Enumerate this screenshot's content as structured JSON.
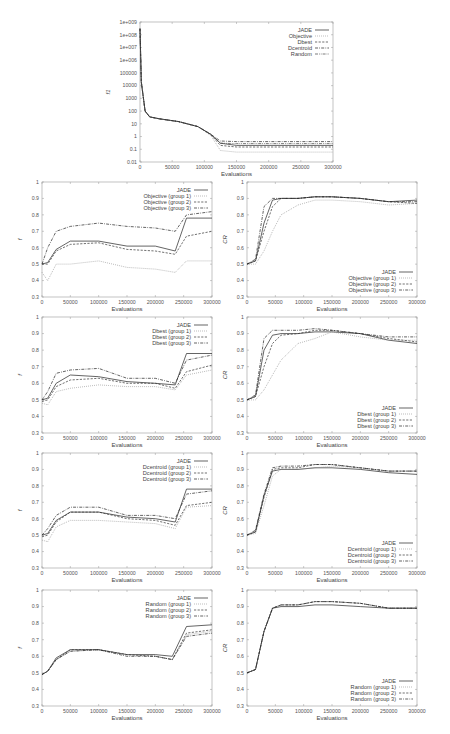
{
  "chart_data": [
    {
      "id": "top",
      "type": "line",
      "title": "",
      "xlabel": "Evaluations",
      "ylabel": "f1",
      "yscale": "log",
      "xlim": [
        0,
        300000
      ],
      "ylim": [
        0.01,
        1000000000
      ],
      "xticks": [
        "0",
        "50000",
        "100000",
        "150000",
        "200000",
        "250000",
        "300000"
      ],
      "yticks": [
        "0.01",
        "0.1",
        "1",
        "10",
        "100",
        "1000",
        "10000",
        "100000",
        "1e+006",
        "1e+007",
        "1e+008",
        "1e+009"
      ],
      "legend_position": "top-right",
      "x": [
        0,
        2000,
        8000,
        15000,
        30000,
        60000,
        90000,
        110000,
        125000,
        150000,
        300000
      ],
      "series": [
        {
          "name": "JADE",
          "style": "solid",
          "values": [
            300000000,
            20000,
            100,
            35,
            25,
            15,
            6,
            1.5,
            0.3,
            0.2,
            0.2
          ]
        },
        {
          "name": "Objective",
          "style": "dotted",
          "values": [
            300000000,
            20000,
            100,
            35,
            25,
            15,
            6,
            1.2,
            0.08,
            0.06,
            0.06
          ]
        },
        {
          "name": "Dbest",
          "style": "dashed",
          "values": [
            300000000,
            20000,
            100,
            35,
            25,
            15,
            6,
            1.4,
            0.2,
            0.15,
            0.15
          ]
        },
        {
          "name": "Dcentroid",
          "style": "dash-dot",
          "values": [
            300000000,
            20000,
            100,
            35,
            25,
            15,
            6,
            1.5,
            0.45,
            0.4,
            0.4
          ]
        },
        {
          "name": "Random",
          "style": "dash-dot-dot",
          "values": [
            300000000,
            20000,
            100,
            35,
            25,
            15,
            6,
            1.5,
            0.3,
            0.28,
            0.28
          ]
        }
      ]
    },
    {
      "id": "objective-f",
      "type": "line",
      "xlabel": "Evaluations",
      "ylabel": "f",
      "xlim": [
        0,
        300000
      ],
      "ylim": [
        0.3,
        1
      ],
      "xticks": [
        "0",
        "50000",
        "100000",
        "150000",
        "200000",
        "250000",
        "300000"
      ],
      "yticks": [
        "0.3",
        "0.4",
        "0.5",
        "0.6",
        "0.7",
        "0.8",
        "0.9",
        "1"
      ],
      "legend_position": "top-right",
      "x": [
        0,
        10000,
        25000,
        50000,
        100000,
        150000,
        200000,
        235000,
        255000,
        300000
      ],
      "series": [
        {
          "name": "JADE",
          "style": "solid",
          "values": [
            0.5,
            0.51,
            0.59,
            0.64,
            0.64,
            0.61,
            0.61,
            0.58,
            0.78,
            0.78
          ]
        },
        {
          "name": "Objective (group 1)",
          "style": "dotted",
          "values": [
            0.45,
            0.4,
            0.5,
            0.5,
            0.52,
            0.48,
            0.47,
            0.45,
            0.52,
            0.52
          ]
        },
        {
          "name": "Objective (group 2)",
          "style": "dashed",
          "values": [
            0.5,
            0.5,
            0.58,
            0.62,
            0.63,
            0.59,
            0.58,
            0.56,
            0.67,
            0.7
          ]
        },
        {
          "name": "Objective (group 3)",
          "style": "dash-dot",
          "values": [
            0.5,
            0.6,
            0.7,
            0.73,
            0.75,
            0.73,
            0.72,
            0.7,
            0.8,
            0.82
          ]
        }
      ]
    },
    {
      "id": "objective-cr",
      "type": "line",
      "xlabel": "Evaluations",
      "ylabel": "CR",
      "xlim": [
        0,
        300000
      ],
      "ylim": [
        0.3,
        1
      ],
      "xticks": [
        "0",
        "50000",
        "100000",
        "150000",
        "200000",
        "250000",
        "300000"
      ],
      "yticks": [
        "0.3",
        "0.4",
        "0.5",
        "0.6",
        "0.7",
        "0.8",
        "0.9",
        "1"
      ],
      "legend_position": "bottom-right",
      "x": [
        0,
        15000,
        30000,
        45000,
        60000,
        90000,
        120000,
        150000,
        200000,
        250000,
        300000
      ],
      "series": [
        {
          "name": "JADE",
          "style": "solid",
          "values": [
            0.5,
            0.52,
            0.75,
            0.89,
            0.9,
            0.9,
            0.91,
            0.91,
            0.9,
            0.88,
            0.89
          ]
        },
        {
          "name": "Objective (group 1)",
          "style": "dotted",
          "values": [
            0.5,
            0.5,
            0.58,
            0.7,
            0.8,
            0.86,
            0.89,
            0.89,
            0.88,
            0.86,
            0.87
          ]
        },
        {
          "name": "Objective (group 2)",
          "style": "dashed",
          "values": [
            0.5,
            0.52,
            0.7,
            0.85,
            0.9,
            0.9,
            0.91,
            0.91,
            0.9,
            0.88,
            0.87
          ]
        },
        {
          "name": "Objective (group 3)",
          "style": "dash-dot",
          "values": [
            0.5,
            0.53,
            0.85,
            0.9,
            0.9,
            0.9,
            0.91,
            0.91,
            0.9,
            0.88,
            0.88
          ]
        }
      ]
    },
    {
      "id": "dbest-f",
      "type": "line",
      "xlabel": "Evaluations",
      "ylabel": "f",
      "xlim": [
        0,
        300000
      ],
      "ylim": [
        0.3,
        1
      ],
      "xticks": [
        "0",
        "50000",
        "100000",
        "150000",
        "200000",
        "250000",
        "300000"
      ],
      "yticks": [
        "0.3",
        "0.4",
        "0.5",
        "0.6",
        "0.7",
        "0.8",
        "0.9",
        "1"
      ],
      "legend_position": "top-right",
      "x": [
        0,
        10000,
        25000,
        50000,
        100000,
        150000,
        200000,
        235000,
        255000,
        300000
      ],
      "series": [
        {
          "name": "JADE",
          "style": "solid",
          "values": [
            0.5,
            0.51,
            0.6,
            0.65,
            0.64,
            0.61,
            0.6,
            0.59,
            0.78,
            0.78
          ]
        },
        {
          "name": "Dbest (group 1)",
          "style": "dotted",
          "values": [
            0.48,
            0.47,
            0.55,
            0.57,
            0.59,
            0.58,
            0.58,
            0.56,
            0.65,
            0.68
          ]
        },
        {
          "name": "Dbest (group 2)",
          "style": "dashed",
          "values": [
            0.49,
            0.5,
            0.58,
            0.62,
            0.63,
            0.6,
            0.6,
            0.57,
            0.67,
            0.71
          ]
        },
        {
          "name": "Dbest (group 3)",
          "style": "dash-dot",
          "values": [
            0.5,
            0.55,
            0.66,
            0.68,
            0.69,
            0.63,
            0.63,
            0.6,
            0.74,
            0.77
          ]
        }
      ]
    },
    {
      "id": "dbest-cr",
      "type": "line",
      "xlabel": "Evaluations",
      "ylabel": "CR",
      "xlim": [
        0,
        300000
      ],
      "ylim": [
        0.3,
        1
      ],
      "xticks": [
        "0",
        "50000",
        "100000",
        "150000",
        "200000",
        "250000",
        "300000"
      ],
      "yticks": [
        "0.3",
        "0.4",
        "0.5",
        "0.6",
        "0.7",
        "0.8",
        "0.9",
        "1"
      ],
      "legend_position": "bottom-right",
      "x": [
        0,
        15000,
        30000,
        45000,
        60000,
        90000,
        120000,
        150000,
        200000,
        250000,
        300000
      ],
      "series": [
        {
          "name": "JADE",
          "style": "solid",
          "values": [
            0.5,
            0.52,
            0.8,
            0.89,
            0.9,
            0.9,
            0.91,
            0.91,
            0.9,
            0.86,
            0.84
          ]
        },
        {
          "name": "Dbest (group 1)",
          "style": "dotted",
          "values": [
            0.5,
            0.5,
            0.56,
            0.65,
            0.74,
            0.84,
            0.87,
            0.91,
            0.88,
            0.86,
            0.86
          ]
        },
        {
          "name": "Dbest (group 2)",
          "style": "dashed",
          "values": [
            0.5,
            0.52,
            0.7,
            0.84,
            0.89,
            0.9,
            0.92,
            0.92,
            0.9,
            0.87,
            0.85
          ]
        },
        {
          "name": "Dbest (group 3)",
          "style": "dash-dot",
          "values": [
            0.5,
            0.53,
            0.87,
            0.92,
            0.92,
            0.92,
            0.93,
            0.92,
            0.9,
            0.88,
            0.88
          ]
        }
      ]
    },
    {
      "id": "dcentroid-f",
      "type": "line",
      "xlabel": "Evaluations",
      "ylabel": "f",
      "xlim": [
        0,
        300000
      ],
      "ylim": [
        0.3,
        1
      ],
      "xticks": [
        "0",
        "50000",
        "100000",
        "150000",
        "200000",
        "250000",
        "300000"
      ],
      "yticks": [
        "0.3",
        "0.4",
        "0.5",
        "0.6",
        "0.7",
        "0.8",
        "0.9",
        "1"
      ],
      "legend_position": "top-right",
      "x": [
        0,
        10000,
        25000,
        50000,
        100000,
        150000,
        200000,
        235000,
        255000,
        300000
      ],
      "series": [
        {
          "name": "JADE",
          "style": "solid",
          "values": [
            0.5,
            0.51,
            0.59,
            0.64,
            0.64,
            0.61,
            0.6,
            0.58,
            0.78,
            0.78
          ]
        },
        {
          "name": "Dcentroid (group 1)",
          "style": "dotted",
          "values": [
            0.47,
            0.46,
            0.55,
            0.59,
            0.59,
            0.58,
            0.57,
            0.54,
            0.67,
            0.68
          ]
        },
        {
          "name": "Dcentroid (group 2)",
          "style": "dashed",
          "values": [
            0.49,
            0.5,
            0.58,
            0.64,
            0.64,
            0.6,
            0.59,
            0.56,
            0.68,
            0.7
          ]
        },
        {
          "name": "Dcentroid (group 3)",
          "style": "dash-dot",
          "values": [
            0.5,
            0.54,
            0.62,
            0.67,
            0.67,
            0.62,
            0.62,
            0.6,
            0.75,
            0.77
          ]
        }
      ]
    },
    {
      "id": "dcentroid-cr",
      "type": "line",
      "xlabel": "Evaluations",
      "ylabel": "CR",
      "xlim": [
        0,
        300000
      ],
      "ylim": [
        0.3,
        1
      ],
      "xticks": [
        "0",
        "50000",
        "100000",
        "150000",
        "200000",
        "250000",
        "300000"
      ],
      "yticks": [
        "0.3",
        "0.4",
        "0.5",
        "0.6",
        "0.7",
        "0.8",
        "0.9",
        "1"
      ],
      "legend_position": "bottom-right",
      "x": [
        0,
        15000,
        30000,
        45000,
        60000,
        90000,
        120000,
        150000,
        200000,
        250000,
        300000
      ],
      "series": [
        {
          "name": "JADE",
          "style": "solid",
          "values": [
            0.5,
            0.52,
            0.74,
            0.89,
            0.9,
            0.9,
            0.91,
            0.91,
            0.9,
            0.88,
            0.87
          ]
        },
        {
          "name": "Dcentroid (group 1)",
          "style": "dotted",
          "values": [
            0.5,
            0.51,
            0.68,
            0.86,
            0.9,
            0.9,
            0.91,
            0.92,
            0.91,
            0.89,
            0.89
          ]
        },
        {
          "name": "Dcentroid (group 2)",
          "style": "dashed",
          "values": [
            0.5,
            0.52,
            0.73,
            0.9,
            0.91,
            0.91,
            0.93,
            0.93,
            0.91,
            0.89,
            0.89
          ]
        },
        {
          "name": "Dcentroid (group 3)",
          "style": "dash-dot",
          "values": [
            0.5,
            0.53,
            0.75,
            0.91,
            0.92,
            0.92,
            0.93,
            0.93,
            0.91,
            0.89,
            0.89
          ]
        }
      ]
    },
    {
      "id": "random-f",
      "type": "line",
      "xlabel": "Evaluations",
      "ylabel": "f",
      "xlim": [
        0,
        300000
      ],
      "ylim": [
        0.3,
        1
      ],
      "xticks": [
        "0",
        "50000",
        "100000",
        "150000",
        "200000",
        "250000",
        "300000"
      ],
      "yticks": [
        "0.3",
        "0.4",
        "0.5",
        "0.6",
        "0.7",
        "0.8",
        "0.9",
        "1"
      ],
      "legend_position": "top-right",
      "x": [
        0,
        10000,
        25000,
        50000,
        100000,
        150000,
        200000,
        230000,
        255000,
        300000
      ],
      "series": [
        {
          "name": "JADE",
          "style": "solid",
          "values": [
            0.49,
            0.51,
            0.59,
            0.64,
            0.64,
            0.61,
            0.61,
            0.6,
            0.78,
            0.79
          ]
        },
        {
          "name": "Random (group 1)",
          "style": "dotted",
          "values": [
            0.49,
            0.51,
            0.58,
            0.63,
            0.64,
            0.61,
            0.6,
            0.58,
            0.73,
            0.75
          ]
        },
        {
          "name": "Random (group 2)",
          "style": "dashed",
          "values": [
            0.49,
            0.51,
            0.58,
            0.64,
            0.64,
            0.61,
            0.6,
            0.58,
            0.74,
            0.76
          ]
        },
        {
          "name": "Random (group 3)",
          "style": "dash-dot",
          "values": [
            0.49,
            0.51,
            0.58,
            0.63,
            0.64,
            0.6,
            0.6,
            0.58,
            0.72,
            0.74
          ]
        }
      ]
    },
    {
      "id": "random-cr",
      "type": "line",
      "xlabel": "Evaluations",
      "ylabel": "CR",
      "xlim": [
        0,
        300000
      ],
      "ylim": [
        0.3,
        1
      ],
      "xticks": [
        "0",
        "50000",
        "100000",
        "150000",
        "200000",
        "250000",
        "300000"
      ],
      "yticks": [
        "0.3",
        "0.4",
        "0.5",
        "0.6",
        "0.7",
        "0.8",
        "0.9",
        "1"
      ],
      "legend_position": "bottom-right",
      "x": [
        0,
        15000,
        30000,
        45000,
        60000,
        90000,
        120000,
        150000,
        200000,
        250000,
        300000
      ],
      "series": [
        {
          "name": "JADE",
          "style": "solid",
          "values": [
            0.5,
            0.52,
            0.75,
            0.89,
            0.9,
            0.9,
            0.91,
            0.91,
            0.9,
            0.89,
            0.89
          ]
        },
        {
          "name": "Random (group 1)",
          "style": "dotted",
          "values": [
            0.5,
            0.52,
            0.75,
            0.89,
            0.91,
            0.91,
            0.93,
            0.93,
            0.92,
            0.89,
            0.89
          ]
        },
        {
          "name": "Random (group 2)",
          "style": "dashed",
          "values": [
            0.5,
            0.52,
            0.75,
            0.89,
            0.91,
            0.91,
            0.93,
            0.93,
            0.92,
            0.89,
            0.89
          ]
        },
        {
          "name": "Random (group 3)",
          "style": "dash-dot",
          "values": [
            0.5,
            0.52,
            0.75,
            0.89,
            0.91,
            0.91,
            0.93,
            0.93,
            0.92,
            0.89,
            0.89
          ]
        }
      ]
    }
  ],
  "layout": {
    "panels": [
      {
        "chart": 0,
        "x": 140,
        "y": 22,
        "w": 193,
        "h": 140
      },
      {
        "chart": 1,
        "x": 42,
        "y": 182,
        "w": 170,
        "h": 115
      },
      {
        "chart": 2,
        "x": 247,
        "y": 182,
        "w": 170,
        "h": 115
      },
      {
        "chart": 3,
        "x": 42,
        "y": 317,
        "w": 170,
        "h": 116
      },
      {
        "chart": 4,
        "x": 247,
        "y": 317,
        "w": 170,
        "h": 116
      },
      {
        "chart": 5,
        "x": 42,
        "y": 453,
        "w": 170,
        "h": 115
      },
      {
        "chart": 6,
        "x": 247,
        "y": 453,
        "w": 170,
        "h": 115
      },
      {
        "chart": 7,
        "x": 42,
        "y": 590,
        "w": 170,
        "h": 116
      },
      {
        "chart": 8,
        "x": 247,
        "y": 590,
        "w": 170,
        "h": 116
      }
    ]
  }
}
